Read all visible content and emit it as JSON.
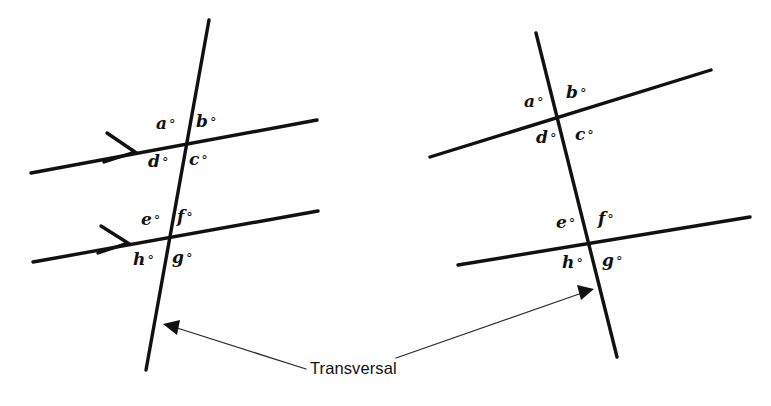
{
  "figure": {
    "width": 771,
    "height": 406,
    "background_color": "#ffffff",
    "line_color": "#111111",
    "leader_color": "#2a2a2a",
    "caption": "Transversal",
    "type": "geometry-diagram"
  },
  "diagrams": [
    {
      "name": "parallel-lines-diagram",
      "lines_are_parallel": true,
      "parallel_tick_marker": "chevron-arrow",
      "angle_labels": {
        "upper": [
          {
            "key": "a",
            "text": "a",
            "degree": "°",
            "position": "upper-left"
          },
          {
            "key": "b",
            "text": "b",
            "degree": "°",
            "position": "upper-right"
          },
          {
            "key": "d",
            "text": "d",
            "degree": "°",
            "position": "lower-left"
          },
          {
            "key": "c",
            "text": "c",
            "degree": "°",
            "position": "lower-right"
          }
        ],
        "lower": [
          {
            "key": "e",
            "text": "e",
            "degree": "°",
            "position": "upper-left"
          },
          {
            "key": "f",
            "text": "f",
            "degree": "°",
            "position": "upper-right"
          },
          {
            "key": "h",
            "text": "h",
            "degree": "°",
            "position": "lower-left"
          },
          {
            "key": "g",
            "text": "g",
            "degree": "°",
            "position": "lower-right"
          }
        ]
      }
    },
    {
      "name": "nonparallel-lines-diagram",
      "lines_are_parallel": false,
      "parallel_tick_marker": "none",
      "angle_labels": {
        "upper": [
          {
            "key": "a",
            "text": "a",
            "degree": "°",
            "position": "upper-left"
          },
          {
            "key": "b",
            "text": "b",
            "degree": "°",
            "position": "upper-right"
          },
          {
            "key": "d",
            "text": "d",
            "degree": "°",
            "position": "lower-left"
          },
          {
            "key": "c",
            "text": "c",
            "degree": "°",
            "position": "lower-right"
          }
        ],
        "lower": [
          {
            "key": "e",
            "text": "e",
            "degree": "°",
            "position": "upper-left"
          },
          {
            "key": "f",
            "text": "f",
            "degree": "°",
            "position": "upper-right"
          },
          {
            "key": "h",
            "text": "h",
            "degree": "°",
            "position": "lower-left"
          },
          {
            "key": "g",
            "text": "g",
            "degree": "°",
            "position": "lower-right"
          }
        ]
      }
    }
  ],
  "labels": {
    "left": {
      "a": "a",
      "b": "b",
      "c": "c",
      "d": "d",
      "e": "e",
      "f": "f",
      "g": "g",
      "h": "h",
      "degree": "°"
    },
    "right": {
      "a": "a",
      "b": "b",
      "c": "c",
      "d": "d",
      "e": "e",
      "f": "f",
      "g": "g",
      "h": "h",
      "degree": "°"
    }
  },
  "callout": {
    "label": "Transversal",
    "points_to": [
      "left-transversal-line",
      "right-transversal-line"
    ]
  }
}
